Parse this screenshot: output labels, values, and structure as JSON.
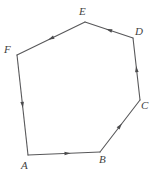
{
  "figure": {
    "name": "directed-hexagon-diagram",
    "background_color": "#ffffff",
    "stroke_color": "#58585a",
    "arrow_color": "#4b4b4d",
    "label_color": "#3f3f41",
    "width": 157,
    "height": 176,
    "vertices": [
      {
        "id": "A",
        "label": "A",
        "x": 28,
        "y": 155,
        "label_x": 21,
        "label_y": 160
      },
      {
        "id": "B",
        "label": "B",
        "x": 100,
        "y": 152,
        "label_x": 99,
        "label_y": 154
      },
      {
        "id": "C",
        "label": "C",
        "x": 140,
        "y": 100,
        "label_x": 141,
        "label_y": 100
      },
      {
        "id": "D",
        "label": "D",
        "x": 133,
        "y": 38,
        "label_x": 135,
        "label_y": 26
      },
      {
        "id": "E",
        "label": "E",
        "x": 85,
        "y": 22,
        "label_x": 79,
        "label_y": 6
      },
      {
        "id": "F",
        "label": "F",
        "x": 17,
        "y": 55,
        "label_x": 4,
        "label_y": 44
      }
    ],
    "edges": [
      {
        "id": "edge-AB",
        "from": "A",
        "to": "B",
        "arrow_t": 0.55,
        "direction": "right"
      },
      {
        "id": "edge-BC",
        "from": "B",
        "to": "C",
        "arrow_t": 0.5,
        "direction": "up-right"
      },
      {
        "id": "edge-CD",
        "from": "C",
        "to": "D",
        "arrow_t": 0.5,
        "direction": "up"
      },
      {
        "id": "edge-DE",
        "from": "D",
        "to": "E",
        "arrow_t": 0.5,
        "direction": "up-left"
      },
      {
        "id": "edge-EF",
        "from": "E",
        "to": "F",
        "arrow_t": 0.5,
        "direction": "down-left"
      },
      {
        "id": "edge-FA",
        "from": "F",
        "to": "A",
        "arrow_t": 0.5,
        "direction": "up"
      }
    ]
  }
}
